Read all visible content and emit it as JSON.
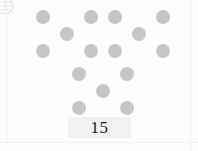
{
  "canvas": {
    "width": 198,
    "height": 151,
    "background_color": "#fdfdfd",
    "border_color": "#f1f1f1"
  },
  "corner_badge": {
    "icon": "circle-outline-icon",
    "label": "",
    "color": "#b8b8b8",
    "note": "partially cropped circular badge at top-left corner"
  },
  "counting_task": {
    "dot_color": "#c6c6c6",
    "dot_diameter_px": 14,
    "arrangement": "quincunx",
    "total_dots": 15,
    "group_count": 3,
    "dots_per_group": 5,
    "groups": [
      {
        "name": "group-left",
        "count": 5,
        "positions": [
          "top-left",
          "top-right",
          "center",
          "bottom-left",
          "bottom-right"
        ]
      },
      {
        "name": "group-right",
        "count": 5,
        "positions": [
          "top-left",
          "top-right",
          "center",
          "bottom-left",
          "bottom-right"
        ]
      },
      {
        "name": "group-bottom",
        "count": 5,
        "positions": [
          "top-left",
          "top-right",
          "center",
          "bottom-left",
          "bottom-right"
        ]
      }
    ]
  },
  "answer": {
    "value": "15",
    "box_color": "#f1f1f1",
    "text_color": "#222222"
  }
}
